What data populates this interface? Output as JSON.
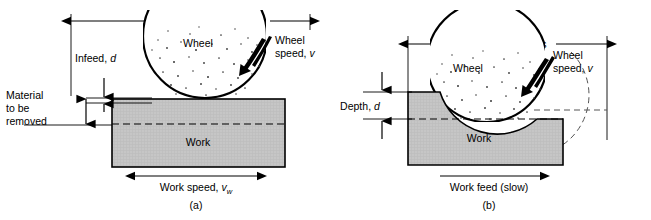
{
  "figure": {
    "background_color": "#ffffff",
    "line_color": "#000000",
    "work_fill_color": "#c4c4c4",
    "wheel_fill_color": "#ffffff"
  },
  "panel_a": {
    "caption": "(a)",
    "stroke_dimension_label": "Typical length of stroke",
    "infeed_label": "Infeed,",
    "infeed_symbol": "d",
    "material_label_line1": "Material",
    "material_label_line2": "to be",
    "material_label_line3": "removed",
    "wheel_label": "Wheel",
    "wheel_speed_label_line1": "Wheel",
    "wheel_speed_label_line2": "speed,",
    "wheel_speed_symbol": "v",
    "work_label": "Work",
    "work_speed_label": "Work speed,",
    "work_speed_symbol": "v",
    "work_speed_subscript": "w"
  },
  "panel_b": {
    "caption": "(b)",
    "pass_dimension_label": "Length of pass",
    "depth_label": "Depth,",
    "depth_symbol": "d",
    "wheel_label": "Wheel",
    "wheel_speed_label_line1": "Wheel",
    "wheel_speed_label_line2": "speed,",
    "wheel_speed_symbol": "v",
    "work_label": "Work",
    "work_feed_label": "Work feed (slow)"
  }
}
